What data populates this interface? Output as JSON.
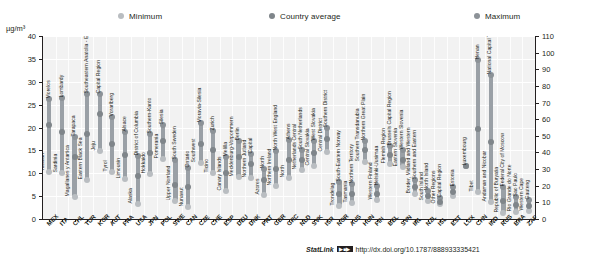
{
  "unit_label": "µg/m³",
  "legend": {
    "items": [
      {
        "label": "Minimum",
        "color": "#b9bdc1"
      },
      {
        "label": "Country average",
        "color": "#7f858a"
      },
      {
        "label": "Maximum",
        "color": "#8c9297"
      }
    ]
  },
  "footer": {
    "statlink_label": "StatLink",
    "badge": "▶■▶",
    "url": "http://dx.doi.org/10.1787/888933335421"
  },
  "chart_data": {
    "type": "bar",
    "title": "",
    "subtitle": "",
    "xlabel": "",
    "ylabel": "µg/m³",
    "ylim": [
      0,
      40
    ],
    "y2lim": [
      0,
      110
    ],
    "yticks": [
      0,
      5,
      10,
      15,
      20,
      25,
      30,
      35,
      40
    ],
    "y2ticks": [
      0,
      10,
      20,
      30,
      40,
      50,
      60,
      70,
      80,
      90,
      100,
      110
    ],
    "grid": true,
    "legend_position": "top",
    "series_names": [
      "Minimum",
      "Country average",
      "Maximum"
    ],
    "left_axis_count": 34,
    "categories": [
      "MEX",
      "ITA",
      "CHL",
      "TUR",
      "KOR",
      "AUT",
      "FRA",
      "USA",
      "JPN",
      "POL",
      "SWE",
      "CAN",
      "CZE",
      "CHE",
      "ESP",
      "DEU",
      "DNK",
      "PRT",
      "GBR",
      "GRC",
      "NLD",
      "SVK",
      "ISR",
      "NOR",
      "AUS",
      "HUN",
      "FIN",
      "BEL",
      "SVN",
      "IRL",
      "NZL",
      "ISL",
      "EST",
      "LUX",
      "CHN",
      "IND",
      "RUS",
      "BRA",
      "ZAF"
    ],
    "points": [
      {
        "code": "MEX",
        "min": 10.3,
        "avg": 20.5,
        "max": 26.2,
        "min_region": "Yucatan",
        "max_region": "Morelos",
        "axis": "left"
      },
      {
        "code": "ITA",
        "min": 10.0,
        "avg": 19.0,
        "max": 26.4,
        "min_region": "Sardinia",
        "max_region": "Lombardy",
        "axis": "left"
      },
      {
        "code": "CHL",
        "min": 4.9,
        "avg": 13.5,
        "max": 17.9,
        "min_region": "Magallanes y Antartica",
        "max_region": "Tarapaca",
        "axis": "left"
      },
      {
        "code": "TUR",
        "min": 8.5,
        "avg": 18.5,
        "max": 27.3,
        "min_region": "Eastern Black Sea",
        "max_region": "Southeastern Anatolia - East",
        "axis": "left"
      },
      {
        "code": "KOR",
        "min": 14.8,
        "avg": 23.0,
        "max": 27.4,
        "min_region": "Jeju",
        "max_region": "Capital Region",
        "axis": "left"
      },
      {
        "code": "AUT",
        "min": 10.2,
        "avg": 16.5,
        "max": 22.2,
        "min_region": "Tyrol",
        "max_region": "Vorarlberg",
        "axis": "left"
      },
      {
        "code": "FRA",
        "min": 8.8,
        "avg": 14.0,
        "max": 19.0,
        "min_region": "Limousin",
        "max_region": "Alsace",
        "axis": "left"
      },
      {
        "code": "USA",
        "min": 3.3,
        "avg": 9.5,
        "max": 13.7,
        "min_region": "Alaska",
        "max_region": "District of Columbia",
        "axis": "left"
      },
      {
        "code": "JPN",
        "min": 9.9,
        "avg": 14.5,
        "max": 18.5,
        "min_region": "Hokkaido",
        "max_region": "Southern-Kanto",
        "axis": "left"
      },
      {
        "code": "POL",
        "min": 13.1,
        "avg": 17.0,
        "max": 20.5,
        "min_region": "Pomerania",
        "max_region": "Silesia",
        "axis": "left"
      },
      {
        "code": "SWE",
        "min": 4.0,
        "avg": 7.5,
        "max": 12.8,
        "min_region": "Upper Norrland",
        "max_region": "South Sweden",
        "axis": "left"
      },
      {
        "code": "CAN",
        "min": 2.7,
        "avg": 7.0,
        "max": 11.2,
        "min_region": "Nunavut",
        "max_region": "Ontario",
        "axis": "left"
      },
      {
        "code": "CZE",
        "min": 12.3,
        "avg": 16.5,
        "max": 21.0,
        "min_region": "Southwest",
        "max_region": "Moravia-Silesia",
        "axis": "left"
      },
      {
        "code": "CHE",
        "min": 10.0,
        "avg": 15.0,
        "max": 19.2,
        "min_region": "Ticino",
        "max_region": "Zurich",
        "axis": "left"
      },
      {
        "code": "ESP",
        "min": 6.1,
        "avg": 10.0,
        "max": 13.5,
        "min_region": "Canary Islands",
        "max_region": "Melilla",
        "axis": "left"
      },
      {
        "code": "DEU",
        "min": 9.2,
        "avg": 13.5,
        "max": 17.1,
        "min_region": "Mecklenburg-Vorpommern",
        "max_region": "Berlin",
        "axis": "left"
      },
      {
        "code": "DNK",
        "min": 8.9,
        "avg": 12.0,
        "max": 14.2,
        "min_region": "Northern Jutland",
        "max_region": "Capital",
        "axis": "left"
      },
      {
        "code": "PRT",
        "min": 5.3,
        "avg": 8.5,
        "max": 11.0,
        "min_region": "Azores",
        "max_region": "North",
        "axis": "left"
      },
      {
        "code": "GBR",
        "min": 7.2,
        "avg": 11.0,
        "max": 14.8,
        "min_region": "Northern Ireland",
        "max_region": "North West England",
        "axis": "left"
      },
      {
        "code": "GRC",
        "min": 9.0,
        "avg": 13.0,
        "max": 17.2,
        "min_region": "North",
        "max_region": "Athens",
        "axis": "left"
      },
      {
        "code": "NLD",
        "min": 10.8,
        "avg": 13.0,
        "max": 15.0,
        "min_region": "Netherlands Central",
        "max_region": "South Netherlands",
        "axis": "left"
      },
      {
        "code": "SVK",
        "min": 11.5,
        "avg": 14.5,
        "max": 17.0,
        "min_region": "Central Slovakia",
        "max_region": "West Slovakia",
        "axis": "left"
      },
      {
        "code": "ISR",
        "min": 14.6,
        "avg": 17.5,
        "max": 20.0,
        "min_region": "Central District",
        "max_region": "Southern District",
        "axis": "left"
      },
      {
        "code": "NOR",
        "min": 2.9,
        "avg": 5.5,
        "max": 8.0,
        "min_region": "Trondelag",
        "max_region": "South-Eastern Norway",
        "axis": "left"
      },
      {
        "code": "AUS",
        "min": 3.5,
        "avg": 5.5,
        "max": 7.6,
        "min_region": "Tasmania",
        "max_region": "Northern Territory",
        "axis": "left"
      },
      {
        "code": "HUN",
        "min": 12.5,
        "avg": 15.0,
        "max": 17.0,
        "min_region": "Southern Transdanubia",
        "max_region": "Northern Great Plain",
        "axis": "left"
      },
      {
        "code": "FIN",
        "min": 4.2,
        "avg": 5.5,
        "max": 7.2,
        "min_region": "Western Finland",
        "max_region": "Helsinki-Uusimaa",
        "axis": "left"
      },
      {
        "code": "BEL",
        "min": 12.0,
        "avg": 14.0,
        "max": 16.0,
        "min_region": "Flemish Region",
        "max_region": "Brussels Capital Region",
        "axis": "left"
      },
      {
        "code": "SVN",
        "min": 11.3,
        "avg": 13.0,
        "max": 15.0,
        "min_region": "Eastern Slovenia",
        "max_region": "Western Slovenia",
        "axis": "left"
      },
      {
        "code": "IRL",
        "min": 5.5,
        "avg": 7.0,
        "max": 8.5,
        "min_region": "Border, Midland and Western",
        "max_region": "Southern and Eastern",
        "axis": "left"
      },
      {
        "code": "NZL",
        "min": 4.0,
        "avg": 5.0,
        "max": 6.2,
        "min_region": "South Island",
        "max_region": "North Island",
        "axis": "left"
      },
      {
        "code": "ISL",
        "min": 3.2,
        "avg": 3.8,
        "max": 4.5,
        "min_region": "Other Regions",
        "max_region": "Capital Region",
        "axis": "left"
      },
      {
        "code": "EST",
        "min": 5.1,
        "avg": 6.0,
        "max": 7.0,
        "min_region": "Estonia",
        "max_region": "Estonia",
        "axis": "left"
      },
      {
        "code": "LUX",
        "min": 11.5,
        "avg": 11.5,
        "max": 11.5,
        "min_region": "Luxembourg",
        "max_region": "Luxembourg",
        "axis": "left"
      },
      {
        "code": "CHN",
        "min": 16.0,
        "avg": 54.0,
        "max": 95.5,
        "min_region": "Tibet",
        "max_region": "Henan",
        "axis": "right"
      },
      {
        "code": "IND",
        "min": 10.5,
        "avg": 46.0,
        "max": 86.5,
        "min_region": "Andaman and Nicobar",
        "max_region": "National Capital Territory of Delhi",
        "axis": "right"
      },
      {
        "code": "RUS",
        "min": 3.5,
        "avg": 11.0,
        "max": 19.5,
        "min_region": "Republic of Buryatia",
        "max_region": "Federal City of Moscow",
        "axis": "right"
      },
      {
        "code": "BRA",
        "min": 4.5,
        "avg": 8.5,
        "max": 13.0,
        "min_region": "Rio Grande do Norte",
        "max_region": "Sao Paulo",
        "axis": "right"
      },
      {
        "code": "ZAF",
        "min": 5.0,
        "avg": 8.0,
        "max": 11.5,
        "min_region": "Western Cape",
        "max_region": "Gauteng",
        "axis": "right"
      }
    ]
  }
}
